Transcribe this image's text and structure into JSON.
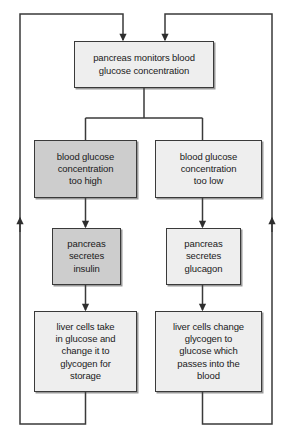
{
  "diagram": {
    "colors": {
      "line": "#3a3a3a",
      "box_border": "#3a3a3a",
      "fill_light": "#eeeeee",
      "fill_highlight": "#cdcdcd",
      "text": "#1a1a1a",
      "background": "#ffffff"
    },
    "nodes": {
      "monitor": {
        "label": "pancreas monitors blood\nglucose concentration",
        "fill": "light"
      },
      "too_high": {
        "label": "blood glucose\nconcentration\ntoo high",
        "fill": "highlight"
      },
      "too_low": {
        "label": "blood glucose\nconcentration\ntoo low",
        "fill": "light"
      },
      "secretes_insulin": {
        "label": "pancreas\nsecretes\ninsulin",
        "fill": "highlight"
      },
      "secretes_glucagon": {
        "label": "pancreas\nsecretes\nglucagon",
        "fill": "light"
      },
      "store_glycogen": {
        "label": "liver cells take\nin glucose and\nchange it to\nglycogen for\nstorage",
        "fill": "light"
      },
      "release_glucose": {
        "label": "liver cells change\nglycogen to\nglucose which\npasses into the\nblood",
        "fill": "light"
      }
    },
    "connectors": [
      {
        "name": "monitor-to-fork",
        "type": "line",
        "arrow": "none"
      },
      {
        "name": "fork-to-too-high",
        "type": "elbow",
        "arrow": "none"
      },
      {
        "name": "fork-to-too-low",
        "type": "elbow",
        "arrow": "none"
      },
      {
        "name": "too-high-to-insulin",
        "type": "line",
        "arrow": "down"
      },
      {
        "name": "too-low-to-glucagon",
        "type": "line",
        "arrow": "down"
      },
      {
        "name": "insulin-to-store",
        "type": "line",
        "arrow": "down"
      },
      {
        "name": "glucagon-to-release",
        "type": "line",
        "arrow": "down"
      },
      {
        "name": "left-feedback-loop",
        "type": "loop",
        "arrow": "up-and-down"
      },
      {
        "name": "right-feedback-loop",
        "type": "loop",
        "arrow": "up-and-down"
      }
    ]
  }
}
